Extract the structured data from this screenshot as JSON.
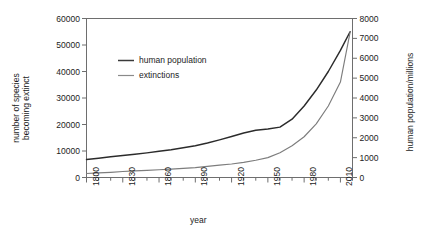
{
  "chart_data": {
    "type": "line",
    "title": "",
    "xlabel": "year",
    "ylabel_left": "number of species becoming extinct",
    "ylabel_left_line1": "number of species",
    "ylabel_left_line2": "becoming extinct",
    "ylabel_right": "human population/millions",
    "xlim": [
      1800,
      2020
    ],
    "xticks": [
      1800,
      1830,
      1860,
      1890,
      1920,
      1950,
      1980,
      2010
    ],
    "xtick_labels": [
      "1800",
      "1830",
      "1860",
      "1890",
      "1920",
      "1950",
      "1980",
      "2010"
    ],
    "xminor_step": 10,
    "ylim_left": [
      0,
      60000
    ],
    "yticks_left": [
      0,
      10000,
      20000,
      30000,
      40000,
      50000,
      60000
    ],
    "ytick_labels_left": [
      "0",
      "10000",
      "20000",
      "30000",
      "40000",
      "50000",
      "60000"
    ],
    "ylim_right": [
      0,
      8000
    ],
    "yticks_right": [
      0,
      1000,
      2000,
      3000,
      4000,
      5000,
      6000,
      7000,
      8000
    ],
    "ytick_labels_right": [
      "0",
      "1000",
      "2000",
      "3000",
      "4000",
      "5000",
      "6000",
      "7000",
      "8000"
    ],
    "grid": false,
    "legend_position": "upper-center-left",
    "legend": [
      {
        "label": "human population",
        "color": "#3a3a3a",
        "axis": "right"
      },
      {
        "label": "extinctions",
        "color": "#8a8a8a",
        "axis": "left"
      }
    ],
    "series": [
      {
        "name": "extinctions",
        "axis": "left",
        "color": "#2b2b2b",
        "units": "number of species becoming extinct",
        "x": [
          1800,
          1810,
          1820,
          1830,
          1840,
          1850,
          1860,
          1870,
          1880,
          1890,
          1900,
          1910,
          1920,
          1930,
          1940,
          1950,
          1960,
          1970,
          1980,
          1990,
          2000,
          2010,
          2018
        ],
        "values": [
          6800,
          7300,
          7800,
          8300,
          8800,
          9300,
          9900,
          10500,
          11200,
          12000,
          13000,
          14200,
          15500,
          16800,
          17800,
          18300,
          19000,
          22000,
          27000,
          33000,
          40000,
          48000,
          55000
        ]
      },
      {
        "name": "human population",
        "axis": "right",
        "color": "#7d7d7d",
        "units": "millions",
        "x": [
          1800,
          1810,
          1820,
          1830,
          1840,
          1850,
          1860,
          1870,
          1880,
          1890,
          1900,
          1910,
          1920,
          1930,
          1940,
          1950,
          1960,
          1970,
          1980,
          1990,
          2000,
          2010,
          2018
        ],
        "values": [
          200,
          230,
          260,
          300,
          330,
          360,
          390,
          420,
          460,
          500,
          560,
          620,
          680,
          760,
          870,
          1000,
          1250,
          1600,
          2050,
          2700,
          3600,
          4800,
          7300
        ]
      }
    ],
    "annotations": []
  },
  "axis_titles": {
    "x": "year",
    "y_left_line1": "number of species",
    "y_left_line2": "becoming extinct",
    "y_right": "human population/millions"
  },
  "legend": {
    "item1_label": "human population",
    "item2_label": "extinctions"
  },
  "colors": {
    "series_dark": "#2b2b2b",
    "series_gray": "#7d7d7d",
    "axis": "#6e6e6e",
    "text": "#1c1c1c",
    "background": "#ffffff"
  }
}
